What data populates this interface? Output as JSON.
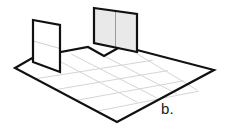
{
  "figure": {
    "label": "b.",
    "label_position": {
      "x": 161,
      "y": 100
    },
    "canvas": {
      "width": 230,
      "height": 127
    },
    "background_color": "#ffffff",
    "style": {
      "outline_color": "#111111",
      "outline_width": 2.2,
      "grid_line_color": "#d5d5d5",
      "grid_line_width": 1,
      "wall_fill_shaded": "#e9e9e9",
      "wall_fill_plain": "#ffffff",
      "wall_grid_color": "#cfcfcf"
    },
    "floor": {
      "name": "floor-slab",
      "outline_points": "15,68 34,57 88,47 104,56 120,47 137,50 214,70 117,122",
      "corners": {
        "left": {
          "x": 15,
          "y": 68
        },
        "right": {
          "x": 214,
          "y": 70
        },
        "bottom": {
          "x": 117,
          "y": 122
        },
        "notch_peak": {
          "x": 88,
          "y": 47
        },
        "notch_valley": {
          "x": 104,
          "y": 56
        },
        "notch_step": {
          "x": 120,
          "y": 47
        },
        "back_right": {
          "x": 137,
          "y": 50
        }
      },
      "grid_columns": 5,
      "grid_rows": 5
    },
    "walls": [
      {
        "name": "left-wall-panel",
        "shaded": false,
        "fill": "#ffffff",
        "points": "33,20 60,25 60,72 33,62",
        "horizontal_divider": true,
        "vertical_dividers": 0
      },
      {
        "name": "back-wall-panel",
        "shaded": true,
        "fill": "#e9e9e9",
        "points": "94,8 137,14 137,52 94,43",
        "horizontal_divider": false,
        "vertical_dividers": 1
      }
    ]
  }
}
